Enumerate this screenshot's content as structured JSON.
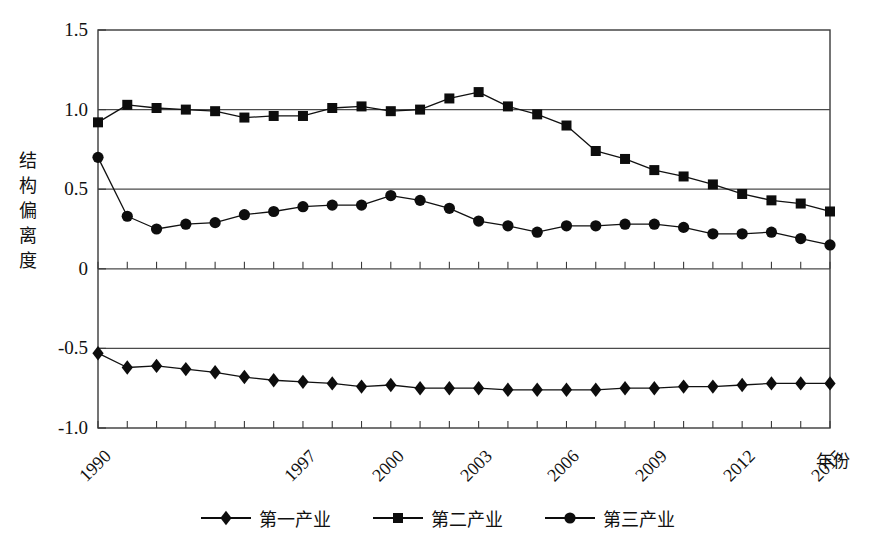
{
  "chart_data": {
    "type": "line",
    "title": "",
    "xlabel": "年份",
    "ylabel": "结构偏离度",
    "ylabel_chars": [
      "结",
      "构",
      "偏",
      "离",
      "度"
    ],
    "grid": true,
    "grid_lines": [
      1.0,
      0.5,
      0.0,
      -0.5
    ],
    "legend_position": "bottom-center",
    "xlim": [
      1990,
      2015
    ],
    "ylim": [
      -1.0,
      1.5
    ],
    "yticks": [
      1.5,
      1.0,
      0.5,
      0,
      -0.5,
      -1.0
    ],
    "ytick_labels": [
      "1.5",
      "1.0",
      "0.5",
      "0",
      "-0.5",
      "-1.0"
    ],
    "x": [
      1990,
      1991,
      1992,
      1993,
      1994,
      1995,
      1996,
      1997,
      1998,
      1999,
      2000,
      2001,
      2002,
      2003,
      2004,
      2005,
      2006,
      2007,
      2008,
      2009,
      2010,
      2011,
      2012,
      2013,
      2014,
      2015
    ],
    "xtick_values": [
      1990,
      1997,
      2000,
      2003,
      2006,
      2009,
      2012,
      2015
    ],
    "xtick_labels": [
      "1990",
      "1997",
      "2000",
      "2003",
      "2006",
      "2009",
      "2012",
      "2015"
    ],
    "series": [
      {
        "name": "第一产业",
        "marker": "diamond",
        "color": "#111111",
        "values": [
          -0.53,
          -0.62,
          -0.61,
          -0.63,
          -0.65,
          -0.68,
          -0.7,
          -0.71,
          -0.72,
          -0.74,
          -0.73,
          -0.75,
          -0.75,
          -0.75,
          -0.76,
          -0.76,
          -0.76,
          -0.76,
          -0.75,
          -0.75,
          -0.74,
          -0.74,
          -0.73,
          -0.72,
          -0.72,
          -0.72
        ]
      },
      {
        "name": "第二产业",
        "marker": "square",
        "color": "#111111",
        "values": [
          0.92,
          1.03,
          1.01,
          1.0,
          0.99,
          0.95,
          0.96,
          0.96,
          1.01,
          1.02,
          0.99,
          1.0,
          1.07,
          1.11,
          1.02,
          0.97,
          0.9,
          0.74,
          0.69,
          0.62,
          0.58,
          0.53,
          0.47,
          0.43,
          0.41,
          0.36
        ]
      },
      {
        "name": "第三产业",
        "marker": "circle",
        "color": "#111111",
        "values": [
          0.7,
          0.33,
          0.25,
          0.28,
          0.29,
          0.34,
          0.36,
          0.39,
          0.4,
          0.4,
          0.46,
          0.43,
          0.38,
          0.3,
          0.27,
          0.23,
          0.27,
          0.27,
          0.28,
          0.28,
          0.26,
          0.22,
          0.22,
          0.23,
          0.19,
          0.15
        ]
      }
    ]
  },
  "legend": [
    {
      "label": "第一产业",
      "marker": "diamond"
    },
    {
      "label": "第二产业",
      "marker": "square"
    },
    {
      "label": "第三产业",
      "marker": "circle"
    }
  ]
}
